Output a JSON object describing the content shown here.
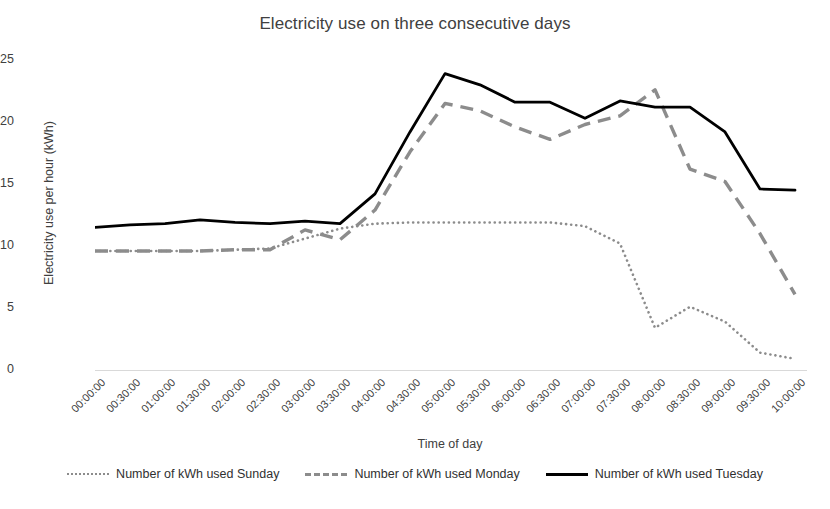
{
  "chart_data": {
    "type": "line",
    "title": "Electricity use on three consecutive days",
    "xlabel": "Time of day",
    "ylabel": "Electricity use per hour (kWh)",
    "ylim": [
      0,
      25
    ],
    "yticks": [
      0,
      5,
      10,
      15,
      20,
      25
    ],
    "grid": false,
    "legend_position": "bottom",
    "categories": [
      "00:00:00",
      "00:30:00",
      "01:00:00",
      "01:30:00",
      "02:00:00",
      "02:30:00",
      "03:00:00",
      "03:30:00",
      "04:00:00",
      "04:30:00",
      "05:00:00",
      "05:30:00",
      "06:00:00",
      "06:30:00",
      "07:00:00",
      "07:30:00",
      "08:00:00",
      "08:30:00",
      "09:00:00",
      "09:30:00",
      "10:00:00"
    ],
    "series": [
      {
        "name": "Number of kWh used Sunday",
        "style": "dotted",
        "color": "#8c8c8c",
        "values": [
          9.6,
          9.6,
          9.6,
          9.6,
          9.7,
          9.8,
          10.6,
          11.4,
          11.8,
          11.9,
          11.9,
          11.9,
          11.9,
          11.9,
          11.6,
          10.2,
          3.4,
          5.1,
          3.9,
          1.4,
          0.9
        ]
      },
      {
        "name": "Number of kWh used Monday",
        "style": "dashed",
        "color": "#8c8c8c",
        "values": [
          9.6,
          9.6,
          9.6,
          9.6,
          9.7,
          9.7,
          11.3,
          10.5,
          12.9,
          17.6,
          21.5,
          20.9,
          19.6,
          18.6,
          19.8,
          20.5,
          22.6,
          16.2,
          15.2,
          11.0,
          6.1
        ]
      },
      {
        "name": "Number of kWh used Tuesday",
        "style": "solid",
        "color": "#000000",
        "values": [
          11.5,
          11.7,
          11.8,
          12.1,
          11.9,
          11.8,
          12.0,
          11.8,
          14.2,
          19.2,
          23.9,
          23.0,
          21.6,
          21.6,
          20.3,
          21.7,
          21.2,
          21.2,
          19.2,
          14.6,
          14.5
        ]
      }
    ]
  },
  "legend": {
    "items": [
      {
        "label": "Number of kWh used Sunday"
      },
      {
        "label": "Number of kWh used Monday"
      },
      {
        "label": "Number of kWh used Tuesday"
      }
    ]
  }
}
